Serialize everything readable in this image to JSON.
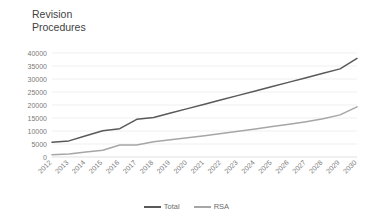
{
  "chart_data": {
    "type": "line",
    "title": "Revision\nProcedures",
    "xlabel": "",
    "ylabel": "",
    "ylim": [
      0,
      40000
    ],
    "ytick_step": 5000,
    "ytick_labels": [
      "40000",
      "35000",
      "30000",
      "25000",
      "20000",
      "15000",
      "10000",
      "5000",
      "0"
    ],
    "grid": true,
    "legend_position": "bottom",
    "categories": [
      "2012",
      "2013",
      "2014",
      "2015",
      "2016",
      "2017",
      "2018",
      "2019",
      "2020",
      "2021",
      "2022",
      "2023",
      "2024",
      "2025",
      "2026",
      "2027",
      "2028",
      "2029",
      "2030"
    ],
    "series": [
      {
        "name": "Total",
        "color": "#595959",
        "values": [
          5700,
          6200,
          8200,
          10100,
          10900,
          14500,
          15200,
          16900,
          18600,
          20300,
          22000,
          23700,
          25400,
          27100,
          28800,
          30500,
          32200,
          33900,
          37900
        ]
      },
      {
        "name": "RSA",
        "color": "#a6a6a6",
        "values": [
          900,
          1200,
          1900,
          2600,
          4600,
          4600,
          5900,
          6600,
          7400,
          8200,
          9000,
          9900,
          10800,
          11700,
          12600,
          13600,
          14700,
          16200,
          19300
        ]
      }
    ]
  },
  "legend": {
    "items": [
      {
        "label": "Total",
        "color": "#595959"
      },
      {
        "label": "RSA",
        "color": "#a6a6a6"
      }
    ]
  }
}
